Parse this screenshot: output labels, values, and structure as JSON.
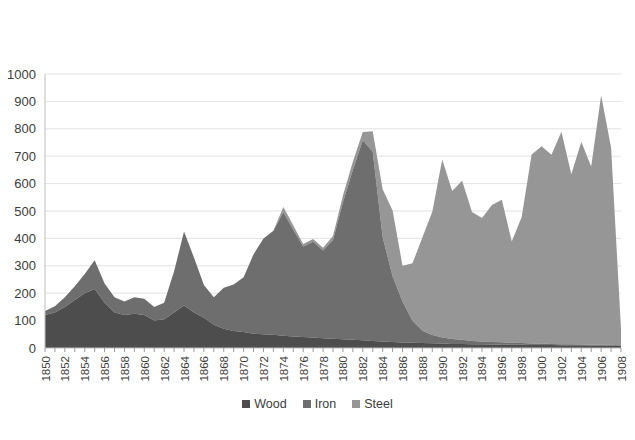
{
  "chart_data": {
    "type": "area",
    "stacked": true,
    "title": "",
    "subtitle": "",
    "xlabel": "",
    "ylabel": "",
    "ylim": [
      0,
      1000
    ],
    "ytick_step": 100,
    "grid": true,
    "legend_position": "bottom",
    "ytick_labels": [
      "0",
      "100",
      "200",
      "300",
      "400",
      "500",
      "600",
      "700",
      "800",
      "900",
      "1000"
    ],
    "yticks": [
      0,
      100,
      200,
      300,
      400,
      500,
      600,
      700,
      800,
      900,
      1000
    ],
    "x": [
      1850,
      1851,
      1852,
      1853,
      1854,
      1855,
      1856,
      1857,
      1858,
      1859,
      1860,
      1861,
      1862,
      1863,
      1864,
      1865,
      1866,
      1867,
      1868,
      1869,
      1870,
      1871,
      1872,
      1873,
      1874,
      1875,
      1876,
      1877,
      1878,
      1879,
      1880,
      1881,
      1882,
      1883,
      1884,
      1885,
      1886,
      1887,
      1888,
      1889,
      1890,
      1891,
      1892,
      1893,
      1894,
      1895,
      1896,
      1897,
      1898,
      1899,
      1900,
      1901,
      1902,
      1903,
      1904,
      1905,
      1906,
      1907,
      1908
    ],
    "xtick_labels": [
      "1850",
      "1852",
      "1854",
      "1856",
      "1858",
      "1860",
      "1862",
      "1864",
      "1866",
      "1868",
      "1870",
      "1872",
      "1874",
      "1876",
      "1878",
      "1880",
      "1882",
      "1884",
      "1886",
      "1888",
      "1890",
      "1892",
      "1894",
      "1896",
      "1898",
      "1900",
      "1902",
      "1904",
      "1906",
      "1908"
    ],
    "series": [
      {
        "name": "Wood",
        "color": "#4d4d4d",
        "values": [
          120,
          130,
          150,
          175,
          200,
          215,
          165,
          130,
          120,
          125,
          120,
          100,
          105,
          130,
          155,
          130,
          110,
          85,
          70,
          62,
          58,
          52,
          50,
          48,
          45,
          42,
          40,
          38,
          36,
          34,
          32,
          30,
          28,
          26,
          24,
          22,
          20,
          19,
          18,
          17,
          16,
          15,
          15,
          14,
          14,
          13,
          13,
          12,
          12,
          11,
          11,
          11,
          10,
          10,
          10,
          9,
          9,
          9,
          8
        ]
      },
      {
        "name": "Iron",
        "color": "#6e6e6e",
        "values": [
          15,
          22,
          35,
          50,
          70,
          105,
          70,
          55,
          50,
          60,
          60,
          50,
          60,
          150,
          270,
          200,
          120,
          100,
          150,
          170,
          200,
          290,
          350,
          380,
          450,
          390,
          330,
          350,
          320,
          360,
          500,
          620,
          730,
          690,
          380,
          240,
          150,
          80,
          45,
          30,
          22,
          18,
          15,
          12,
          10,
          9,
          8,
          7,
          6,
          5,
          5,
          4,
          4,
          4,
          3,
          3,
          3,
          3,
          2
        ]
      },
      {
        "name": "Steel",
        "color": "#969696",
        "values": [
          0,
          0,
          0,
          0,
          0,
          0,
          0,
          0,
          0,
          0,
          0,
          0,
          0,
          0,
          0,
          0,
          0,
          0,
          0,
          0,
          0,
          0,
          0,
          0,
          20,
          15,
          10,
          10,
          10,
          15,
          25,
          30,
          30,
          75,
          175,
          240,
          130,
          210,
          340,
          450,
          650,
          540,
          580,
          470,
          450,
          500,
          520,
          370,
          460,
          690,
          720,
          690,
          775,
          620,
          740,
          650,
          910,
          720,
          60
        ]
      }
    ]
  },
  "legend": {
    "items": [
      {
        "label": "Wood",
        "color": "#4d4d4d"
      },
      {
        "label": "Iron",
        "color": "#6e6e6e"
      },
      {
        "label": "Steel",
        "color": "#969696"
      }
    ]
  }
}
